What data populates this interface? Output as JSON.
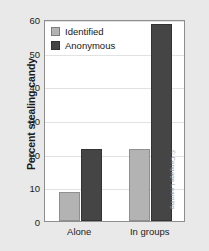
{
  "chart_data": {
    "type": "bar",
    "title": "",
    "xlabel": "",
    "ylabel": "Percent stealing candy",
    "categories": [
      "Alone",
      "In groups"
    ],
    "series": [
      {
        "name": "Identified",
        "color": "#b3b3b3",
        "values": [
          8.5,
          21.5
        ]
      },
      {
        "name": "Anonymous",
        "color": "#454545",
        "values": [
          21.5,
          58.5
        ]
      }
    ],
    "ylim": [
      0,
      60
    ],
    "yticks": [
      0,
      10,
      20,
      30,
      40,
      50,
      60
    ],
    "ytick_labels": [
      "0",
      "10",
      "20",
      "30",
      "40",
      "50",
      "60"
    ],
    "grid": true,
    "legend_position": "top-left-inside"
  },
  "credit": "© Cengage Learning"
}
